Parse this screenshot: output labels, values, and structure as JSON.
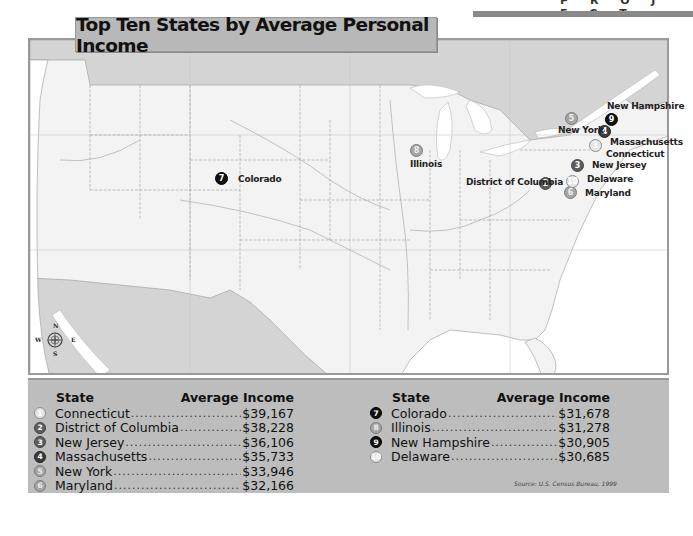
{
  "header": {
    "partial_text": "P R O J E C T",
    "bar_color": "#8a8a8a"
  },
  "title": "Top Ten States by Average Personal Income",
  "map": {
    "colors": {
      "land_us": "#f3f3f3",
      "land_other": "#d4d4d4",
      "water": "#ffffff",
      "border": "#9a9a9a"
    },
    "compass": {
      "n": "N",
      "s": "S",
      "e": "E",
      "w": "W"
    },
    "markers": [
      {
        "rank": "1",
        "label": "Connecticut",
        "style": "m-white",
        "x": 595,
        "y": 145,
        "lx": 606,
        "ly": 155
      },
      {
        "rank": "2",
        "label": "District of Columbia",
        "style": "m-mid",
        "x": 545,
        "y": 183,
        "lx": 466,
        "ly": 183
      },
      {
        "rank": "3",
        "label": "New Jersey",
        "style": "m-mid",
        "x": 577,
        "y": 165,
        "lx": 592,
        "ly": 166
      },
      {
        "rank": "4",
        "label": "Massachusetts",
        "style": "m-dark",
        "x": 604,
        "y": 131,
        "lx": 610,
        "ly": 143
      },
      {
        "rank": "5",
        "label": "New York",
        "style": "m-light",
        "x": 571,
        "y": 118,
        "lx": 558,
        "ly": 131
      },
      {
        "rank": "6",
        "label": "Maryland",
        "style": "m-light",
        "x": 570,
        "y": 192,
        "lx": 585,
        "ly": 194
      },
      {
        "rank": "7",
        "label": "Colorado",
        "style": "m-black",
        "x": 221,
        "y": 178,
        "lx": 238,
        "ly": 180
      },
      {
        "rank": "8",
        "label": "Illinois",
        "style": "m-light",
        "x": 416,
        "y": 150,
        "lx": 410,
        "ly": 165
      },
      {
        "rank": "9",
        "label": "New Hampshire",
        "style": "m-black",
        "x": 611,
        "y": 119,
        "lx": 607,
        "ly": 107
      },
      {
        "rank": "10",
        "label": "Delaware",
        "style": "m-white",
        "x": 572,
        "y": 181,
        "lx": 587,
        "ly": 180
      }
    ]
  },
  "legend": {
    "col_headers": {
      "state": "State",
      "income": "Average Income"
    },
    "left": [
      {
        "rank": "1",
        "state": "Connecticut",
        "income": "$39,167",
        "style": "m-white"
      },
      {
        "rank": "2",
        "state": "District of Columbia",
        "income": "$38,228",
        "style": "m-mid"
      },
      {
        "rank": "3",
        "state": "New Jersey",
        "income": "$36,106",
        "style": "m-mid"
      },
      {
        "rank": "4",
        "state": "Massachusetts",
        "income": "$35,733",
        "style": "m-dark"
      },
      {
        "rank": "5",
        "state": "New York",
        "income": "$33,946",
        "style": "m-light"
      },
      {
        "rank": "6",
        "state": "Maryland",
        "income": "$32,166",
        "style": "m-light"
      }
    ],
    "right": [
      {
        "rank": "7",
        "state": "Colorado",
        "income": "$31,678",
        "style": "m-black"
      },
      {
        "rank": "8",
        "state": "Illinois",
        "income": "$31,278",
        "style": "m-light"
      },
      {
        "rank": "9",
        "state": "New Hampshire",
        "income": "$30,905",
        "style": "m-black"
      },
      {
        "rank": "10",
        "state": "Delaware",
        "income": "$30,685",
        "style": "m-white"
      }
    ],
    "source": "Source: U.S. Census Bureau, 1999",
    "panel_color": "#bdbdbd"
  }
}
